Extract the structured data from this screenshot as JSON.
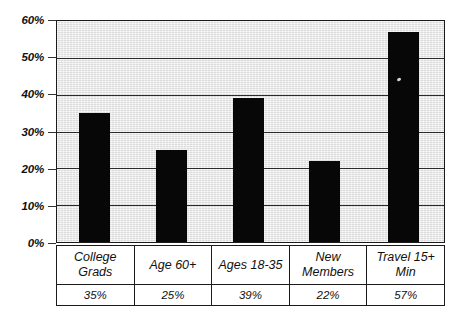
{
  "chart_data": {
    "type": "bar",
    "title": "",
    "xlabel": "",
    "ylabel": "",
    "categories": [
      "College Grads",
      "Age 60+",
      "Ages 18-35",
      "New Members",
      "Travel 15+ Min"
    ],
    "values": [
      35,
      25,
      39,
      22,
      57
    ],
    "value_labels": [
      "35%",
      "25%",
      "39%",
      "22%",
      "57%"
    ],
    "ylim": [
      0,
      60
    ],
    "ytick_values": [
      0,
      10,
      20,
      30,
      40,
      50,
      60
    ],
    "ytick_labels": [
      "0%",
      "10%",
      "20%",
      "30%",
      "40%",
      "50%",
      "60%"
    ],
    "grid": true,
    "legend": "none",
    "bar_color": "#070707",
    "plot_background": "#e6e6e6",
    "gridline_color": "#2a2a2a",
    "axis_color": "#1b1b1b",
    "data_table_visible": true,
    "data_table": {
      "category_row": [
        "College Grads",
        "Age 60+",
        "Ages 18-35",
        "New Members",
        "Travel 15+ Min"
      ],
      "value_row": [
        "35%",
        "25%",
        "39%",
        "22%",
        "57%"
      ]
    }
  },
  "figure": {
    "cropped_title_fragment": ""
  }
}
